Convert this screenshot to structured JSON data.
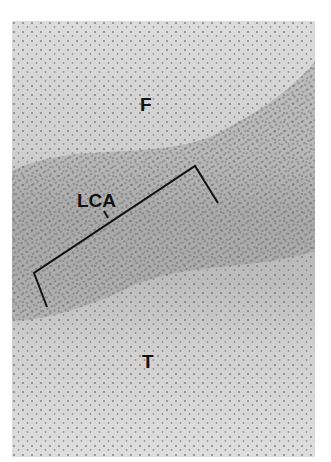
{
  "figure": {
    "labels": {
      "top_region": "F",
      "middle_region": "LCA",
      "bottom_region": "T"
    },
    "bracket": {
      "spans": "LCA",
      "color": "#111111"
    },
    "colors": {
      "background": "#ffffff",
      "tissue_light": "#d6d6d6",
      "tissue_dark_band": "#9a9a9a",
      "nuclei": "#555555"
    }
  }
}
